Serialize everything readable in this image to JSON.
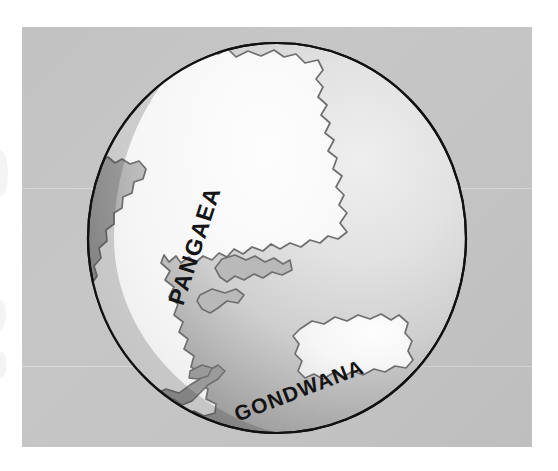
{
  "figure": {
    "kind": "globe-diagram",
    "background_color": "#ffffff",
    "panel_color": "#c4c4c4",
    "ocean_shadow_color": "#808080",
    "ocean_light_color": "#d0d0d0",
    "land_color": "#f4f4f4",
    "land_outline_color": "#6e6e6e",
    "globe_outline_color": "#111111",
    "label_color": "#141414"
  },
  "labels": {
    "pangaea": "PANGAEA",
    "gondwana": "GONDWANA"
  },
  "globe": {
    "center_x": 277,
    "center_y": 238,
    "radius_x": 190,
    "radius_y": 196
  }
}
